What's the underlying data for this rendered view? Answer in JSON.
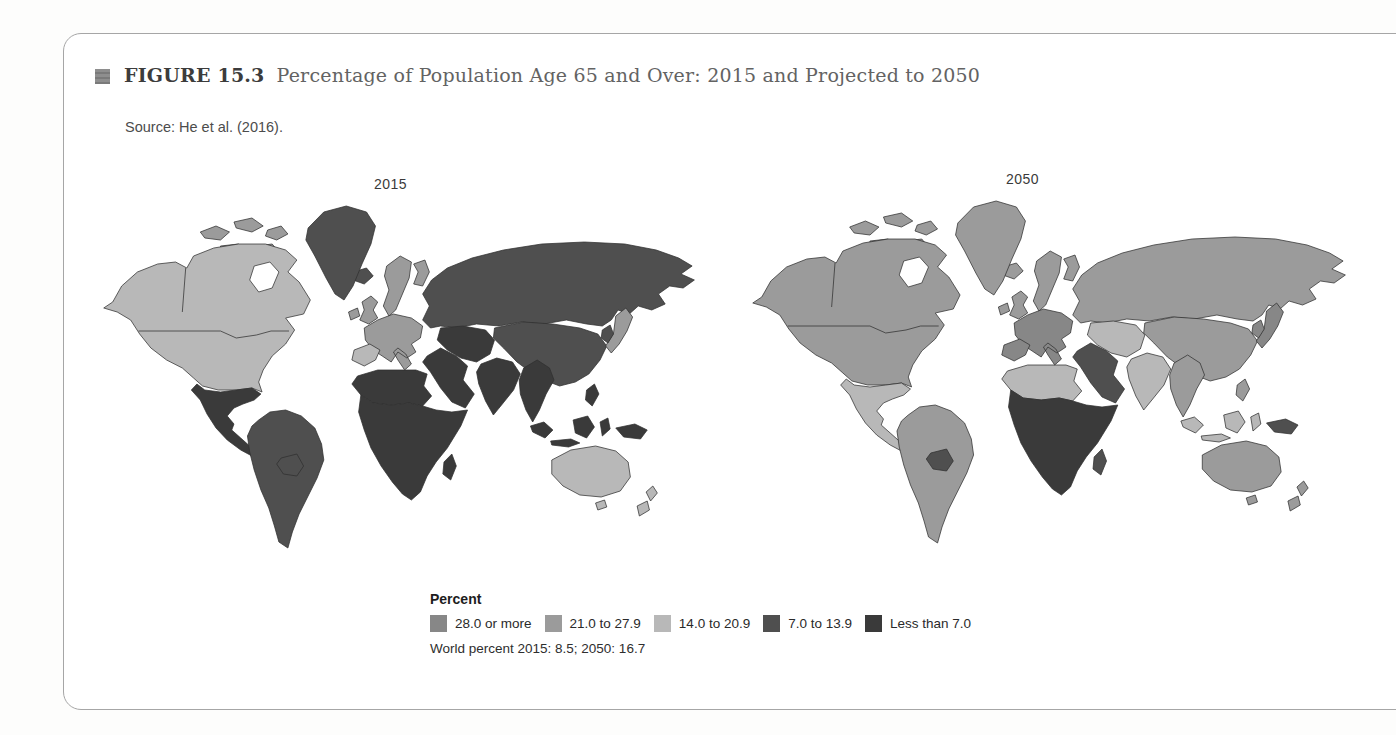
{
  "figure": {
    "label": "FIGURE 15.3",
    "title": "Percentage of Population Age 65 and Over: 2015 and Projected to 2050",
    "source": "Source: He et al. (2016)."
  },
  "legend": {
    "heading": "Percent",
    "categories": [
      {
        "label": "28.0 or more",
        "color": "#878787"
      },
      {
        "label": "21.0 to 27.9",
        "color": "#9b9b9b"
      },
      {
        "label": "14.0 to 20.9",
        "color": "#b8b8b8"
      },
      {
        "label": "7.0 to 13.9",
        "color": "#4f4f4f"
      },
      {
        "label": "Less than 7.0",
        "color": "#3a3a3a"
      }
    ],
    "note": "World percent 2015: 8.5; 2050: 16.7"
  },
  "world_percent": {
    "y2015": "8.5",
    "y2050": "16.7"
  },
  "maps": [
    {
      "year": "2015",
      "regions": {
        "usa_canada": "14.0 to 20.9",
        "canada_islands": "21.0 to 27.9",
        "greenland": "7.0 to 13.9",
        "iceland": "7.0 to 13.9",
        "mexico_central_america": "Less than 7.0",
        "south_america": "7.0 to 13.9",
        "bolivia": "7.0 to 13.9",
        "uk_ireland": "21.0 to 27.9",
        "scandinavia": "21.0 to 27.9",
        "europe_west": "21.0 to 27.9",
        "iberia": "14.0 to 20.9",
        "russia": "7.0 to 13.9",
        "central_asia": "Less than 7.0",
        "china": "7.0 to 13.9",
        "middle_east": "Less than 7.0",
        "africa_north": "Less than 7.0",
        "africa_sub": "Less than 7.0",
        "madagascar": "Less than 7.0",
        "india": "Less than 7.0",
        "se_asia": "Less than 7.0",
        "indonesia": "Less than 7.0",
        "papua": "Less than 7.0",
        "japan": "21.0 to 27.9",
        "korea": "7.0 to 13.9",
        "australia": "14.0 to 20.9",
        "new_zealand": "14.0 to 20.9"
      }
    },
    {
      "year": "2050",
      "regions": {
        "usa_canada": "21.0 to 27.9",
        "canada_islands": "21.0 to 27.9",
        "greenland": "21.0 to 27.9",
        "iceland": "21.0 to 27.9",
        "mexico_central_america": "14.0 to 20.9",
        "south_america": "21.0 to 27.9",
        "bolivia": "7.0 to 13.9",
        "uk_ireland": "21.0 to 27.9",
        "scandinavia": "21.0 to 27.9",
        "europe_west": "28.0 or more",
        "iberia": "28.0 or more",
        "russia": "21.0 to 27.9",
        "central_asia": "14.0 to 20.9",
        "china": "21.0 to 27.9",
        "middle_east": "7.0 to 13.9",
        "africa_north": "14.0 to 20.9",
        "africa_sub": "Less than 7.0",
        "madagascar": "7.0 to 13.9",
        "india": "14.0 to 20.9",
        "se_asia": "21.0 to 27.9",
        "indonesia": "14.0 to 20.9",
        "papua": "7.0 to 13.9",
        "japan": "28.0 or more",
        "korea": "28.0 or more",
        "australia": "21.0 to 27.9",
        "new_zealand": "21.0 to 27.9"
      }
    }
  ]
}
